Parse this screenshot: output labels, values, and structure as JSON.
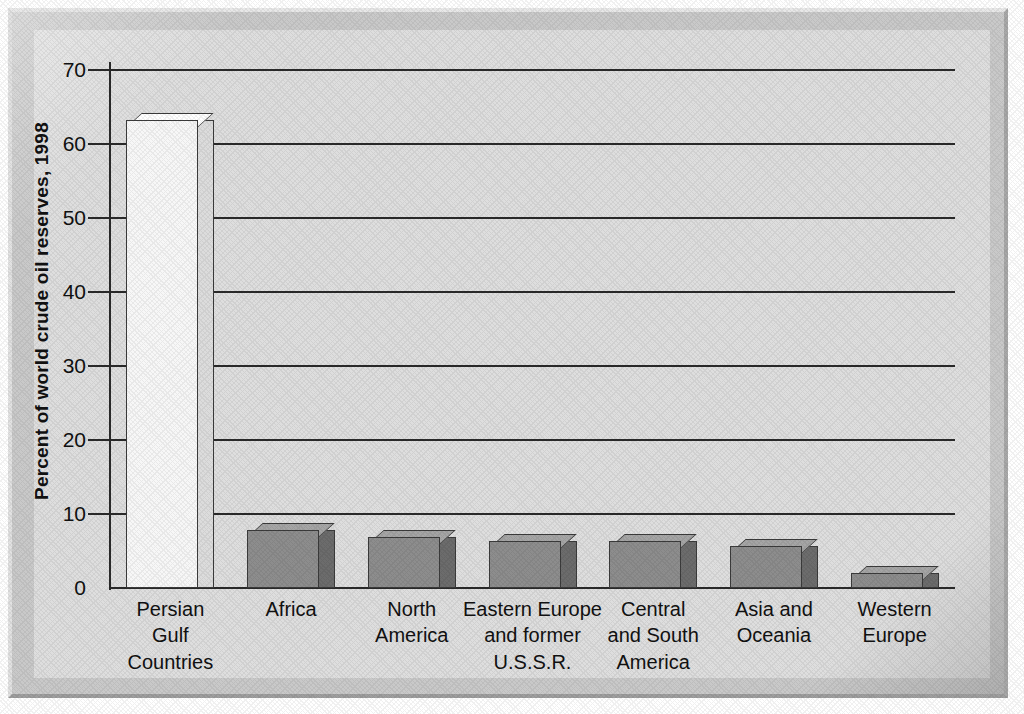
{
  "chart_data": {
    "type": "bar",
    "title": "",
    "xlabel": "",
    "ylabel": "Percent of world crude oil reserves, 1998",
    "ylim": [
      0,
      70
    ],
    "ytick_step": 10,
    "yticks": [
      "0",
      "10",
      "20",
      "30",
      "40",
      "50",
      "60",
      "70"
    ],
    "grid": true,
    "legend": "none",
    "style": "3d-bar",
    "categories": [
      "Persian\nGulf\nCountries",
      "Africa",
      "North\nAmerica",
      "Eastern Europe\nand former\nU.S.S.R.",
      "Central\nand South\nAmerica",
      "Asia and\nOceania",
      "Western\nEurope"
    ],
    "category_lines": [
      [
        "Persian",
        "Gulf",
        "Countries"
      ],
      [
        "Africa"
      ],
      [
        "North",
        "America"
      ],
      [
        "Eastern Europe",
        "and former",
        "U.S.S.R."
      ],
      [
        "Central",
        "and South",
        "America"
      ],
      [
        "Asia and",
        "Oceania"
      ],
      [
        "Western",
        "Europe"
      ]
    ],
    "values": [
      63.2,
      7.8,
      6.9,
      6.4,
      6.3,
      5.7,
      2.0
    ],
    "bar_colors": [
      "#f7f7f7",
      "#8d8d8d",
      "#8d8d8d",
      "#8d8d8d",
      "#8d8d8d",
      "#8d8d8d",
      "#8d8d8d"
    ],
    "bar_side_colors": [
      "#dcdcdc",
      "#6c6c6c",
      "#6c6c6c",
      "#6c6c6c",
      "#6c6c6c",
      "#6c6c6c",
      "#6c6c6c"
    ],
    "bar_top_colors": [
      "#ffffff",
      "#a5a5a5",
      "#a5a5a5",
      "#a5a5a5",
      "#a5a5a5",
      "#a5a5a5",
      "#a5a5a5"
    ]
  },
  "colors": {
    "axis": "#2a2a2a",
    "gridline": "#2a2a2a",
    "plot_background": "#dedede",
    "frame_background": "#c9c9c9",
    "text": "#111111"
  }
}
